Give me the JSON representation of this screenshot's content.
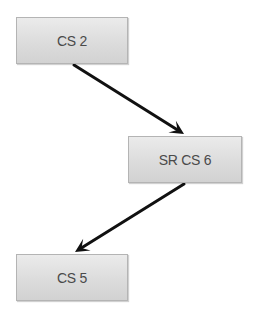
{
  "diagram": {
    "type": "flow",
    "colors": {
      "node_border": "#b4b4b4",
      "node_fill_top": "#ebebeb",
      "node_fill_bottom": "#d2d2d2",
      "text": "#4a4a4a",
      "arrow": "#111111"
    },
    "nodes": [
      {
        "id": "cs2",
        "label": "CS 2",
        "x": 16,
        "y": 17,
        "w": 112,
        "h": 47
      },
      {
        "id": "srcs6",
        "label": "SR CS 6",
        "x": 128,
        "y": 136,
        "w": 114,
        "h": 47
      },
      {
        "id": "cs5",
        "label": "CS 5",
        "x": 16,
        "y": 254,
        "w": 112,
        "h": 47
      }
    ],
    "edges": [
      {
        "from": "cs2",
        "to": "srcs6",
        "x1": 74,
        "y1": 65,
        "x2": 184,
        "y2": 134
      },
      {
        "from": "srcs6",
        "to": "cs5",
        "x1": 184,
        "y1": 184,
        "x2": 75,
        "y2": 252
      }
    ]
  }
}
